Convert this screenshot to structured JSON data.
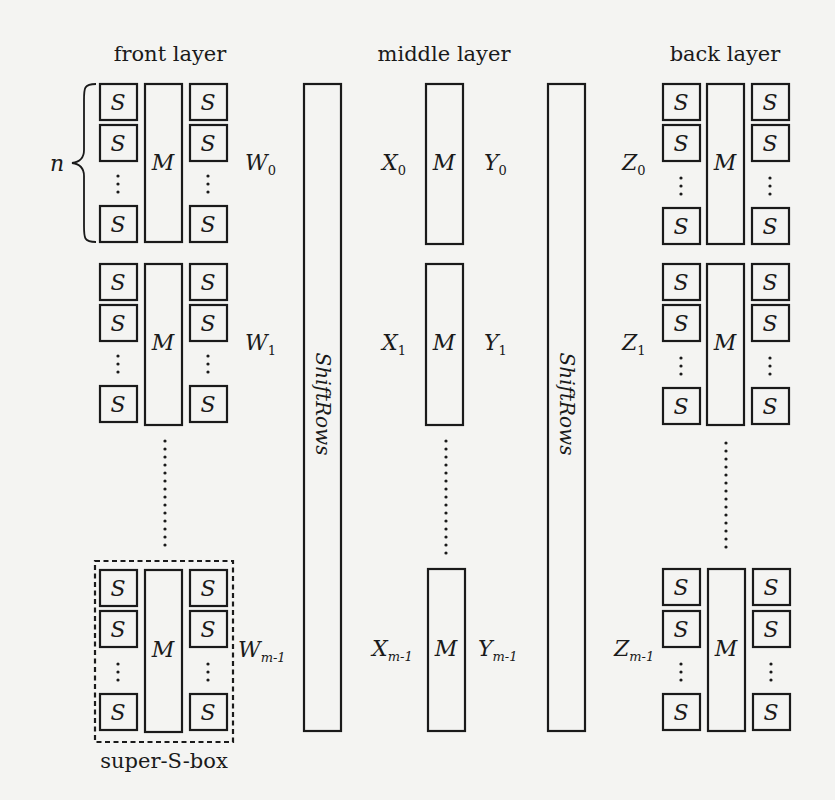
{
  "headers": {
    "front": "front layer",
    "middle": "middle layer",
    "back": "back layer"
  },
  "labels": {
    "s_box": "S",
    "mix": "M",
    "brace_var": "n",
    "shift_rows": "ShiftRows",
    "super_sbox": "super-S-box",
    "vdots": "⋮"
  },
  "state_words": {
    "W": {
      "base": "W",
      "subs": [
        "0",
        "1",
        "m-1"
      ]
    },
    "X": {
      "base": "X",
      "subs": [
        "0",
        "1",
        "m-1"
      ]
    },
    "Y": {
      "base": "Y",
      "subs": [
        "0",
        "1",
        "m-1"
      ]
    },
    "Z": {
      "base": "Z",
      "subs": [
        "0",
        "1",
        "m-1"
      ]
    }
  },
  "colors": {
    "ink": "#1a1a1a",
    "background": "#f4f4f2"
  }
}
